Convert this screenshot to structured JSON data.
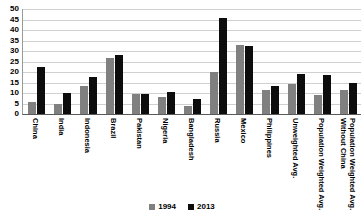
{
  "chart_data": {
    "type": "bar",
    "title": "",
    "subtitle": "",
    "xlabel": "",
    "ylabel": "",
    "ylim": [
      0,
      50
    ],
    "yticks": [
      0,
      5,
      10,
      15,
      20,
      25,
      30,
      35,
      40,
      45,
      50
    ],
    "grid": true,
    "legend_position": "bottom-center",
    "categories": [
      "China",
      "India",
      "Indonesia",
      "Brazil",
      "Pakistan",
      "Nigeria",
      "Bangladesh",
      "Russia",
      "Mexico",
      "Philippines",
      "Unweighted Avg.",
      "Population Weighted Avg.",
      "Population Weighted Avg.\nWithout China"
    ],
    "series": [
      {
        "name": "1994",
        "color": "#808080",
        "values": [
          5.5,
          5.0,
          13.5,
          26.5,
          9.5,
          8.0,
          4.0,
          20.0,
          33.0,
          11.5,
          14.5,
          9.0,
          11.5
        ]
      },
      {
        "name": "2013",
        "color": "#0d0d0d",
        "values": [
          22.4,
          10.2,
          17.8,
          28.0,
          9.5,
          10.5,
          7.0,
          45.5,
          32.5,
          13.5,
          19.0,
          18.5,
          15.0
        ]
      }
    ]
  }
}
